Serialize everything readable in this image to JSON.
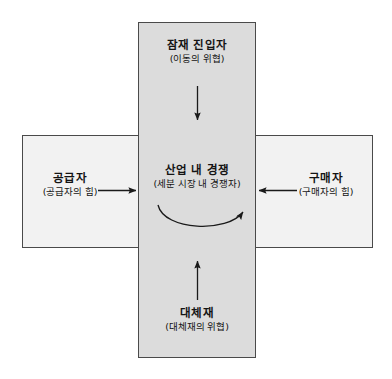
{
  "diagram": {
    "background_color": "#ffffff",
    "border_color": "#4a4a4a",
    "vertical_bar_color": "#dcdcdc",
    "horizontal_bar_color": "#f2f2f2",
    "center_color": "#dcdcdc",
    "text_color": "#141414",
    "arrow_color": "#1a1a1a"
  },
  "nodes": {
    "entrants": {
      "title": "잠재 진입자",
      "subtitle": "(이동의 위협)",
      "position": "top"
    },
    "suppliers": {
      "title": "공급자",
      "subtitle": "(공급자의 힘)",
      "position": "left"
    },
    "rivalry": {
      "title": "산업 내 경쟁",
      "subtitle": "(세분 시장 내 경쟁자)",
      "position": "center"
    },
    "buyers": {
      "title": "구매자",
      "subtitle": "(구매자의 힘)",
      "position": "right"
    },
    "substitutes": {
      "title": "대체재",
      "subtitle": "(대체재의 위협)",
      "position": "bottom"
    }
  },
  "arrows": [
    {
      "name": "arrow-entrants-to-rivalry",
      "direction": "down",
      "from": "entrants",
      "to": "rivalry"
    },
    {
      "name": "arrow-suppliers-to-rivalry",
      "direction": "right",
      "from": "suppliers",
      "to": "rivalry"
    },
    {
      "name": "arrow-buyers-to-rivalry",
      "direction": "left",
      "from": "buyers",
      "to": "rivalry"
    },
    {
      "name": "arrow-substitutes-to-rivalry",
      "direction": "up",
      "from": "substitutes",
      "to": "rivalry"
    },
    {
      "name": "arrow-rivalry-internal-curve",
      "direction": "curved-up-right",
      "from": "rivalry",
      "to": "rivalry"
    }
  ]
}
